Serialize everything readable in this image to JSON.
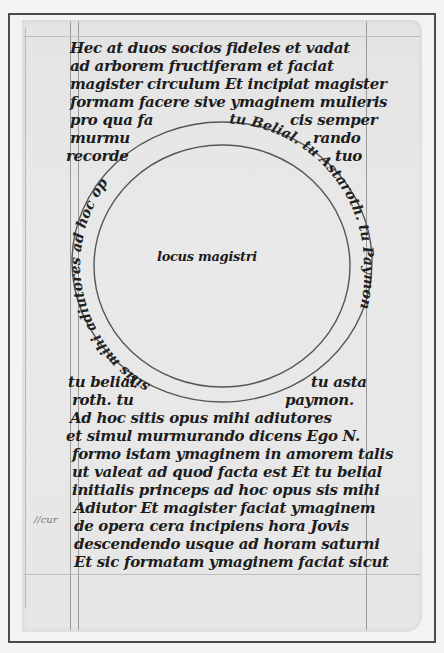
{
  "manuscript": {
    "top_lines": [
      {
        "text": "Hec at duos socios fideles et vadat",
        "x": 70,
        "y": 53
      },
      {
        "text": "ad arborem fructiferam et faciat",
        "x": 70,
        "y": 71
      },
      {
        "text": "magister circulum Et incipiat magister",
        "x": 70,
        "y": 89
      },
      {
        "text": "formam facere sive ymaginem mulieris",
        "x": 70,
        "y": 107
      }
    ],
    "side_left": [
      {
        "text": "pro qua fa",
        "x": 70,
        "y": 125
      },
      {
        "text": "murmu",
        "x": 70,
        "y": 143
      },
      {
        "text": "recorde",
        "x": 66,
        "y": 161
      }
    ],
    "side_right": [
      {
        "text": "cis semper",
        "x": 290,
        "y": 125
      },
      {
        "text": "rando",
        "x": 313,
        "y": 143
      },
      {
        "text": "tuo",
        "x": 335,
        "y": 161
      }
    ],
    "circle": {
      "center_text": "locus magistri",
      "ring_text_top": "tu Belial. tu Astaroth. tu Paymon",
      "ring_text_bottom": "sitis mihi adiutores ad hoc opus",
      "stroke_color": "#555555"
    },
    "bottom_side_left": [
      {
        "text": "tu belial",
        "x": 68,
        "y": 387
      },
      {
        "text": "roth. tu",
        "x": 72,
        "y": 405
      }
    ],
    "bottom_side_right": [
      {
        "text": "tu asta",
        "x": 311,
        "y": 387
      },
      {
        "text": "paymon.",
        "x": 285,
        "y": 405
      }
    ],
    "bottom_lines": [
      {
        "text": "Ad hoc sitis opus mihi adiutores",
        "x": 70,
        "y": 423
      },
      {
        "text": "et simul murmurando dicens Ego N.",
        "x": 66,
        "y": 441
      },
      {
        "text": "formo istam ymaginem in amorem talis",
        "x": 72,
        "y": 459
      },
      {
        "text": "ut valeat ad quod facta est Et tu belial",
        "x": 72,
        "y": 477
      },
      {
        "text": "initialis princeps ad hoc opus sis mihi",
        "x": 72,
        "y": 495
      },
      {
        "text": "Adiutor Et magister faciat ymaginem",
        "x": 74,
        "y": 513
      },
      {
        "text": "de opera cera incipiens hora Jovis",
        "x": 74,
        "y": 531
      },
      {
        "text": "descendendo usque ad horam saturni",
        "x": 74,
        "y": 549
      },
      {
        "text": "Et sic formatam ymaginem faciat sicut",
        "x": 74,
        "y": 567
      }
    ],
    "margin_note": {
      "text": "//cur",
      "x": 34,
      "y": 514
    }
  },
  "colors": {
    "ink": "#1c1c1c",
    "parchment": "#e6e6e6",
    "frame": "#4a4a4a",
    "ruling": "#9a9a9a"
  }
}
